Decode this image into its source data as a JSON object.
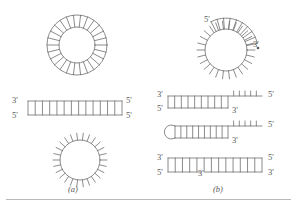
{
  "figure": {
    "type": "nucleic-acid-structure-diagram",
    "stroke_color": "#6e6e70",
    "text_color": "#58585a",
    "background": "#ffffff",
    "panels": [
      {
        "id": "a",
        "label": "(a)",
        "label_x": 68,
        "label_y": 185,
        "structures": [
          {
            "name": "circular-duplex",
            "kind": "circle-double-stranded",
            "cx": 77,
            "cy": 45,
            "r_inner": 18,
            "r_outer": 30,
            "rungs": 26,
            "labels": []
          },
          {
            "name": "linear-duplex",
            "kind": "linear-double-stranded",
            "x1": 28,
            "x2": 122,
            "y_top": 101,
            "y_bottom": 115,
            "rungs": 13,
            "labels": [
              {
                "text": "3'",
                "x": 12,
                "y": 96
              },
              {
                "text": "5'",
                "x": 12,
                "y": 111
              },
              {
                "text": "5'",
                "x": 126,
                "y": 96
              },
              {
                "text": "5'",
                "x": 126,
                "y": 111
              }
            ]
          },
          {
            "name": "single-stranded-circle",
            "kind": "circle-single-stranded",
            "cx": 80,
            "cy": 160,
            "r": 20,
            "tick_len": 7,
            "ticks": 26,
            "labels": []
          }
        ]
      },
      {
        "id": "b",
        "label": "(b)",
        "label_x": 213,
        "label_y": 185,
        "structures": [
          {
            "name": "circle-with-duplex-arc",
            "kind": "circle-partially-double-stranded",
            "cx": 226,
            "cy": 50,
            "r": 21,
            "tick_len": 8,
            "ticks": 26,
            "arc_start_deg": -118,
            "arc_end_deg": -12,
            "arc_r": 32,
            "labels": [
              {
                "text": "5'",
                "x": 204,
                "y": 15
              },
              {
                "text": "3'",
                "x": 253,
                "y": 40
              }
            ],
            "marker": {
              "name": "arrow-dot",
              "x": 258,
              "y": 48
            }
          },
          {
            "name": "partial-duplex-top",
            "kind": "linear-partial-duplex",
            "x1": 168,
            "x2": 262,
            "duplex_end": 228,
            "y_top": 96,
            "y_bottom": 108,
            "rungs_duplex": 9,
            "ticks_single": 5,
            "labels": [
              {
                "text": "3'",
                "x": 157,
                "y": 90
              },
              {
                "text": "5'",
                "x": 157,
                "y": 104
              },
              {
                "text": "3'",
                "x": 232,
                "y": 106
              },
              {
                "text": "5'",
                "x": 268,
                "y": 90
              }
            ]
          },
          {
            "name": "hairpin-partial-duplex",
            "kind": "hairpin-loop-duplex",
            "x1": 175,
            "x2": 262,
            "duplex_end": 228,
            "y_top": 126,
            "y_bottom": 138,
            "loop_cx": 175,
            "loop_r": 7,
            "rungs_duplex": 9,
            "ticks_single": 5,
            "labels": [
              {
                "text": "3'",
                "x": 232,
                "y": 136
              },
              {
                "text": "5'",
                "x": 268,
                "y": 120
              }
            ]
          },
          {
            "name": "nicked-duplex",
            "kind": "linear-double-stranded-nicked",
            "x1": 168,
            "x2": 262,
            "y_top": 158,
            "y_bottom": 172,
            "rungs": 13,
            "nick_x": 203,
            "labels": [
              {
                "text": "3'",
                "x": 157,
                "y": 153
              },
              {
                "text": "5'",
                "x": 157,
                "y": 168
              },
              {
                "text": "3'",
                "x": 198,
                "y": 169
              },
              {
                "text": "5'",
                "x": 268,
                "y": 153
              },
              {
                "text": "3'",
                "x": 268,
                "y": 168
              }
            ]
          }
        ]
      }
    ],
    "rules": [
      {
        "name": "bottom-rule",
        "y": 199
      }
    ]
  }
}
